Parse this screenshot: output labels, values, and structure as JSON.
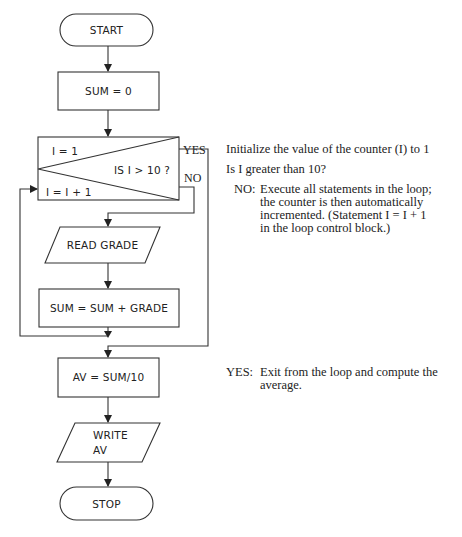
{
  "flowchart": {
    "nodes": {
      "start": {
        "type": "terminal",
        "label": "START"
      },
      "init_sum": {
        "type": "process",
        "label": "SUM = 0"
      },
      "loop_control": {
        "type": "loop-control",
        "init_label": "I = 1",
        "test_label": "IS I > 10 ?",
        "increment_label": "I = I + 1",
        "yes_label": "YES",
        "no_label": "NO"
      },
      "read_grade": {
        "type": "input-output",
        "label": "READ GRADE"
      },
      "accumulate": {
        "type": "process",
        "label": "SUM = SUM + GRADE"
      },
      "average": {
        "type": "process",
        "label": "AV = SUM/10"
      },
      "write_av": {
        "type": "input-output",
        "line1": "WRITE",
        "line2": "AV"
      },
      "stop": {
        "type": "terminal",
        "label": "STOP"
      }
    },
    "edges": [
      {
        "from": "start",
        "to": "init_sum"
      },
      {
        "from": "init_sum",
        "to": "loop_control"
      },
      {
        "from": "loop_control",
        "to": "read_grade",
        "label": "NO"
      },
      {
        "from": "read_grade",
        "to": "accumulate"
      },
      {
        "from": "accumulate",
        "to": "loop_control",
        "note": "loop back to increment"
      },
      {
        "from": "loop_control",
        "to": "average",
        "label": "YES"
      },
      {
        "from": "average",
        "to": "write_av"
      },
      {
        "from": "write_av",
        "to": "stop"
      }
    ]
  },
  "annotations": {
    "init": "Initialize the value of the counter (I) to 1",
    "test": "Is I greater than 10?",
    "no": {
      "tag": "NO:",
      "lines": [
        "Execute all statements in the loop;",
        "the counter is then automatically",
        "incremented. (Statement I = I + 1",
        "in the loop control block.)"
      ]
    },
    "yes": {
      "tag": "YES:",
      "lines": [
        "Exit from the loop and compute the",
        "average."
      ]
    }
  },
  "colors": {
    "ink": "#333333",
    "background": "#ffffff"
  }
}
